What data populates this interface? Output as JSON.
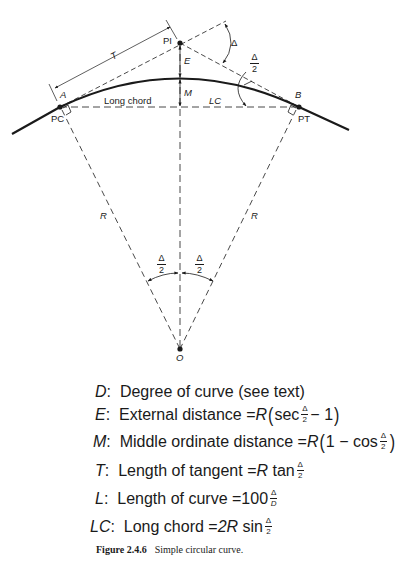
{
  "figure": {
    "number": "Figure 2.4.6",
    "title": "Simple circular curve."
  },
  "labels": {
    "pi": "PI",
    "pc": "PC",
    "pt": "PT",
    "a": "A",
    "b": "B",
    "o": "O",
    "t": "T",
    "e": "E",
    "m": "M",
    "lc": "LC",
    "long_chord": "Long chord",
    "r_left": "R",
    "r_right": "R",
    "delta": "Δ",
    "half_num": "Δ",
    "half_den": "2"
  },
  "definitions": [
    {
      "symbol": "D",
      "text": "Degree of curve (see text)"
    },
    {
      "symbol": "E",
      "text": "External distance = ",
      "formula": "R(sec Δ/2 − 1)"
    },
    {
      "symbol": "M",
      "text": "Middle ordinate distance = ",
      "formula": "R(1 − cos Δ/2)"
    },
    {
      "symbol": "T",
      "text": "Length of tangent = ",
      "formula": "R tan Δ/2"
    },
    {
      "symbol": "L",
      "text": "Length of curve = ",
      "formula": "100 Δ/D"
    },
    {
      "symbol": "LC",
      "text": "Long chord = ",
      "formula": "2R sin Δ/2"
    }
  ],
  "formula_parts": {
    "R": "R",
    "sec": "sec",
    "cos": "cos",
    "tan": "tan",
    "sin": "sin",
    "minus_one": "− 1",
    "one_minus": "1 −",
    "hundred": "100",
    "two_r": "2R",
    "delta": "Δ",
    "two": "2",
    "D": "D",
    "lparen": "(",
    "rparen": ")"
  }
}
